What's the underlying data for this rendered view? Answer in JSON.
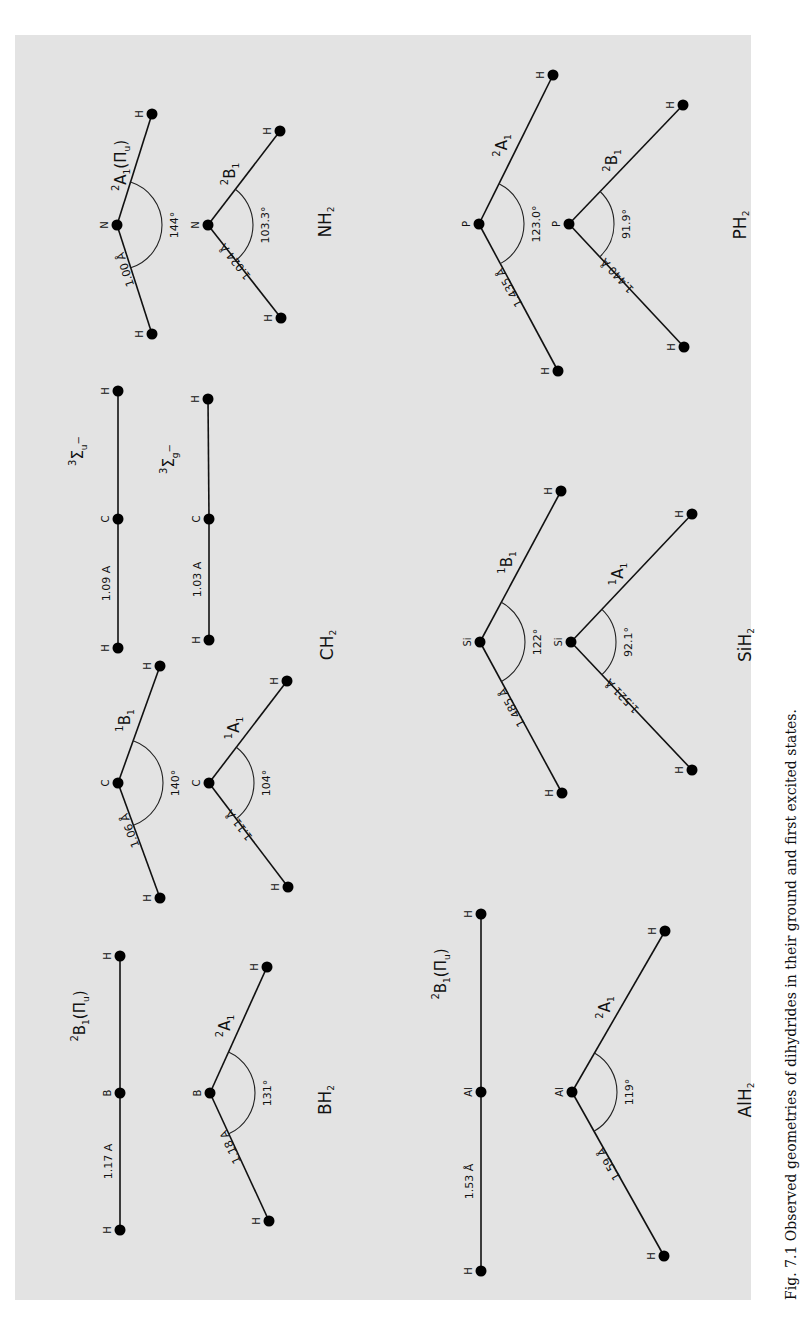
{
  "figure": {
    "caption": "Fig. 7.1 Observed geometries of dihydrides in their ground and first excited states.",
    "background": "#e3e3e3",
    "orientation": "rotated 90° counter-clockwise (text reads bottom-to-top)",
    "molecules": [
      {
        "name": "NH2",
        "name_main": "NH",
        "name_sub": "2",
        "label_pos": [
          325,
          222
        ],
        "states": [
          {
            "symbol": "2A1(Πu)",
            "sup": "2",
            "main": "A",
            "sub": "1",
            "extra": "(Π",
            "extra_sub": "u",
            "extra_end": ")",
            "geometry": "bent",
            "central": "N",
            "bond": "1.00 Å",
            "angle": "144°",
            "atoms": {
              "h1": [
                152,
                114
              ],
              "c": [
                117,
                225
              ],
              "h2": [
                152,
                334
              ]
            }
          },
          {
            "symbol": "2B1",
            "sup": "2",
            "main": "B",
            "sub": "1",
            "geometry": "bent",
            "central": "N",
            "bond": "1.024 Å",
            "angle": "103.3°",
            "atoms": {
              "h1": [
                280,
                131
              ],
              "c": [
                208,
                225
              ],
              "h2": [
                281,
                318
              ]
            }
          }
        ]
      },
      {
        "name": "PH2",
        "name_main": "PH",
        "name_sub": "2",
        "label_pos": [
          740,
          225
        ],
        "states": [
          {
            "symbol": "2A1",
            "sup": "2",
            "main": "A",
            "sub": "1",
            "geometry": "bent",
            "central": "P",
            "bond": "1.435 Å",
            "angle": "123.0°",
            "atoms": {
              "h1": [
                553,
                75
              ],
              "c": [
                479,
                224
              ],
              "h2": [
                558,
                371
              ]
            }
          },
          {
            "symbol": "2B1",
            "sup": "2",
            "main": "B",
            "sub": "1",
            "geometry": "bent",
            "central": "P",
            "bond": "1.440 Å",
            "angle": "91.9°",
            "atoms": {
              "h1": [
                683,
                105
              ],
              "c": [
                569,
                224
              ],
              "h2": [
                684,
                347
              ]
            }
          }
        ]
      },
      {
        "name": "CH2",
        "name_main": "CH",
        "name_sub": "2",
        "label_pos": [
          327,
          645
        ],
        "states": [
          {
            "symbol": "3Σu−",
            "sup": "3",
            "main": "Σ",
            "sub": "u",
            "supr": "−",
            "geometry": "linear",
            "central": "C",
            "bond": "1.09 A",
            "atoms": {
              "h1": [
                118,
                391
              ],
              "c": [
                118,
                519
              ],
              "h2": [
                118,
                648
              ]
            }
          },
          {
            "symbol": "3Σg−",
            "sup": "3",
            "main": "Σ",
            "sub": "g",
            "supr": "−",
            "geometry": "linear",
            "central": "C",
            "bond": "1.03 A",
            "atoms": {
              "h1": [
                208,
                399
              ],
              "c": [
                209,
                519
              ],
              "h2": [
                209,
                640
              ]
            }
          },
          {
            "symbol": "1B1",
            "sup": "1",
            "main": "B",
            "sub": "1",
            "geometry": "bent",
            "central": "C",
            "bond": "1.06 Å",
            "angle": "140°",
            "atoms": {
              "h1": [
                160,
                666
              ],
              "c": [
                118,
                783
              ],
              "h2": [
                160,
                898
              ]
            }
          },
          {
            "symbol": "1A1",
            "sup": "1",
            "main": "A",
            "sub": "1",
            "geometry": "bent",
            "central": "C",
            "bond": "1.11 Å",
            "angle": "104°",
            "atoms": {
              "h1": [
                287,
                681
              ],
              "c": [
                209,
                783
              ],
              "h2": [
                288,
                887
              ]
            }
          }
        ]
      },
      {
        "name": "SiH2",
        "name_main": "SiH",
        "name_sub": "2",
        "label_pos": [
          745,
          645
        ],
        "states": [
          {
            "symbol": "1B1",
            "sup": "1",
            "main": "B",
            "sub": "1",
            "geometry": "bent",
            "central": "Si",
            "bond": "1.485 Å",
            "angle": "122°",
            "atoms": {
              "h1": [
                561,
                491
              ],
              "c": [
                480,
                642
              ],
              "h2": [
                562,
                793
              ]
            }
          },
          {
            "symbol": "1A1",
            "sup": "1",
            "main": "A",
            "sub": "1",
            "geometry": "bent",
            "central": "Si",
            "bond": "1.521 Å",
            "angle": "92.1°",
            "atoms": {
              "h1": [
                692,
                514
              ],
              "c": [
                571,
                642
              ],
              "h2": [
                692,
                770
              ]
            }
          }
        ]
      },
      {
        "name": "BH2",
        "name_main": "BH",
        "name_sub": "2",
        "label_pos": [
          325,
          1100
        ],
        "states": [
          {
            "symbol": "2B1(Πu)",
            "sup": "2",
            "main": "B",
            "sub": "1",
            "extra": "(Π",
            "extra_sub": "u",
            "extra_end": ")",
            "geometry": "linear",
            "central": "B",
            "bond": "1.17 A",
            "atoms": {
              "h1": [
                120,
                956
              ],
              "c": [
                120,
                1093
              ],
              "h2": [
                120,
                1230
              ]
            }
          },
          {
            "symbol": "2A1",
            "sup": "2",
            "main": "A",
            "sub": "1",
            "geometry": "bent",
            "central": "B",
            "bond": "1.18 A",
            "angle": "131°",
            "atoms": {
              "h1": [
                267,
                967
              ],
              "c": [
                210,
                1093
              ],
              "h2": [
                269,
                1221
              ]
            }
          }
        ]
      },
      {
        "name": "AlH2",
        "name_main": "AlH",
        "name_sub": "2",
        "label_pos": [
          745,
          1100
        ],
        "states": [
          {
            "symbol": "2B1(Πu)",
            "sup": "2",
            "main": "B",
            "sub": "1",
            "extra": "(Π",
            "extra_sub": "u",
            "extra_end": ")",
            "geometry": "linear",
            "central": "Al",
            "bond": "1.53 Å",
            "atoms": {
              "h1": [
                481,
                914
              ],
              "c": [
                481,
                1092
              ],
              "h2": [
                481,
                1271
              ]
            }
          },
          {
            "symbol": "2A1",
            "sup": "2",
            "main": "A",
            "sub": "1",
            "geometry": "bent",
            "central": "Al",
            "bond": "1.59 Å",
            "angle": "119°",
            "atoms": {
              "h1": [
                665,
                931
              ],
              "c": [
                572,
                1092
              ],
              "h2": [
                664,
                1256
              ]
            }
          }
        ]
      }
    ]
  }
}
